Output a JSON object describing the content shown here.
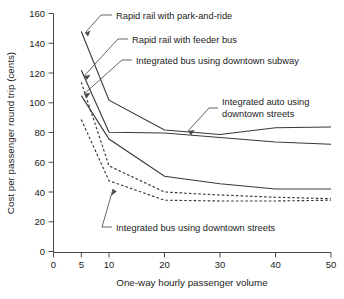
{
  "chart_data": {
    "type": "line",
    "title": "",
    "xlabel": "One-way hourly passenger volume",
    "ylabel": "Cost per passenger round trip (cents)",
    "xlim": [
      0,
      50
    ],
    "ylim": [
      0,
      160
    ],
    "xticks": [
      0,
      5,
      10,
      20,
      30,
      40,
      50
    ],
    "yticks": [
      0,
      20,
      40,
      60,
      80,
      100,
      120,
      140,
      160
    ],
    "xtick_labels": [
      "0",
      "5",
      "10",
      "20",
      "30",
      "40",
      "50"
    ],
    "ytick_labels": [
      "0",
      "20",
      "40",
      "60",
      "80",
      "100",
      "120",
      "140",
      "160"
    ],
    "grid": false,
    "legend": "annotations-with-leader-lines",
    "x": [
      5,
      10,
      20,
      30,
      40,
      50
    ],
    "series": [
      {
        "name": "Rapid rail with park-and-ride",
        "style": "solid",
        "values": [
          148,
          102,
          82,
          79,
          83.5,
          84
        ]
      },
      {
        "name": "Rapid rail with feeder bus",
        "style": "solid",
        "values": [
          122,
          80.5,
          80,
          77,
          74,
          72.5
        ]
      },
      {
        "name": "Integrated bus using downtown subway",
        "style": "solid",
        "values": [
          105,
          76,
          51,
          46,
          42.5,
          42.5
        ]
      },
      {
        "name": "Integrated auto using downtown streets",
        "style": "dashed",
        "values": [
          114,
          58,
          40.5,
          38.5,
          37,
          36
        ]
      },
      {
        "name": "Integrated bus using downtown streets",
        "style": "dashed",
        "values": [
          89,
          48,
          35,
          34.5,
          34.5,
          35
        ]
      }
    ],
    "annotations": [
      {
        "id": "rapid-rail-park-and-ride",
        "lines": [
          "Rapid rail with park-and-ride"
        ],
        "points_to_series": "Rapid rail with park-and-ride"
      },
      {
        "id": "rapid-rail-feeder-bus",
        "lines": [
          "Rapid rail with feeder bus"
        ],
        "points_to_series": "Rapid rail with feeder bus"
      },
      {
        "id": "integrated-bus-downtown-subway",
        "lines": [
          "Integrated bus using downtown subway"
        ],
        "points_to_series": "Integrated bus using downtown subway"
      },
      {
        "id": "integrated-auto-downtown-streets",
        "lines": [
          "Integrated auto using",
          "downtown streets"
        ],
        "points_to_series": "Integrated auto using downtown streets"
      },
      {
        "id": "integrated-bus-downtown-streets",
        "lines": [
          "Integrated bus using downtown streets"
        ],
        "points_to_series": "Integrated bus using downtown streets"
      }
    ]
  }
}
